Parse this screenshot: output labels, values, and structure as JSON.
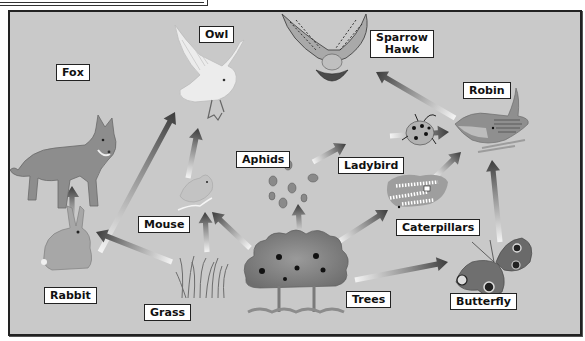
{
  "diagram": {
    "organisms": {
      "fox": "Fox",
      "owl": "Owl",
      "sparrow_hawk": "Sparrow\nHawk",
      "robin": "Robin",
      "aphids": "Aphids",
      "ladybird": "Ladybird",
      "mouse": "Mouse",
      "caterpillars": "Caterpillars",
      "rabbit": "Rabbit",
      "grass": "Grass",
      "trees": "Trees",
      "butterfly": "Butterfly"
    },
    "feeding_links": [
      {
        "from": "Rabbit",
        "to": "Fox"
      },
      {
        "from": "Rabbit",
        "to": "Owl"
      },
      {
        "from": "Mouse",
        "to": "Owl"
      },
      {
        "from": "Grass",
        "to": "Rabbit"
      },
      {
        "from": "Grass",
        "to": "Mouse"
      },
      {
        "from": "Trees",
        "to": "Mouse"
      },
      {
        "from": "Trees",
        "to": "Aphids"
      },
      {
        "from": "Aphids",
        "to": "Ladybird"
      },
      {
        "from": "Ladybird",
        "to": "Robin"
      },
      {
        "from": "Trees",
        "to": "Caterpillars"
      },
      {
        "from": "Caterpillars",
        "to": "Robin"
      },
      {
        "from": "Trees",
        "to": "Butterfly"
      },
      {
        "from": "Butterfly",
        "to": "Robin"
      },
      {
        "from": "Robin",
        "to": "Sparrow Hawk"
      }
    ]
  }
}
